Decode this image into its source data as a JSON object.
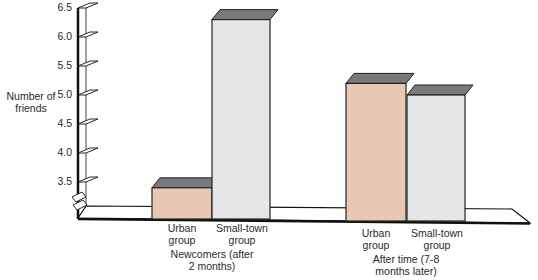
{
  "chart_data": {
    "type": "bar",
    "style": "3d-grouped-bar",
    "title": "",
    "xlabel": "",
    "ylabel": "Number of friends",
    "ylim": [
      3.0,
      6.5
    ],
    "yticks": [
      "3.5",
      "4.0",
      "4.5",
      "5.0",
      "5.5",
      "6.0",
      "6.5"
    ],
    "axis_break": true,
    "grid": false,
    "legend": null,
    "categories": [
      "Newcomers (after 2 months)",
      "After time (7-8 months later)"
    ],
    "category_labels": [
      [
        "Newcomers (after",
        "2 months)"
      ],
      [
        "After time (7-8",
        "months later)"
      ]
    ],
    "series": [
      {
        "name": "Urban group",
        "label_lines": [
          "Urban",
          "group"
        ],
        "color": "#e8c8b2",
        "values": [
          3.4,
          5.2
        ]
      },
      {
        "name": "Small-town group",
        "label_lines": [
          "Small-town",
          "group"
        ],
        "color": "#e4e6e8",
        "values": [
          6.3,
          5.0
        ]
      }
    ],
    "top_face_color": "#7a7a7a"
  }
}
